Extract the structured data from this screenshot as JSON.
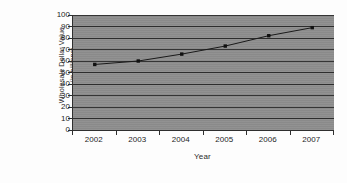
{
  "chart_data": {
    "type": "line",
    "title": "",
    "xlabel": "Year",
    "ylabel": "Wholesale Dollar Value (in billions)",
    "ylabel_line1": "Wholesale Dollar Value",
    "ylabel_line2": "(in billions)",
    "categories": [
      "2002",
      "2003",
      "2004",
      "2005",
      "2006",
      "2007"
    ],
    "values": [
      57,
      60,
      66,
      73,
      82,
      89
    ],
    "series": [
      {
        "name": "Wholesale Dollar Value",
        "values": [
          57,
          60,
          66,
          73,
          82,
          89
        ]
      }
    ],
    "ylim": [
      0,
      100
    ],
    "yticks": [
      0,
      10,
      20,
      30,
      40,
      50,
      60,
      70,
      80,
      90,
      100
    ],
    "ytick_labels": [
      "0",
      "10",
      "20",
      "30",
      "40",
      "50",
      "60",
      "70",
      "80",
      "90",
      "100"
    ],
    "grid": true,
    "grid_axis": "y",
    "legend": "none",
    "marker": "square",
    "colors": {
      "plot_background": "#8e8e8e",
      "figure_background": "#fdfdfd",
      "gridline": "#2e2e2e",
      "axis": "#2f2f2f",
      "line": "#1a1a1a",
      "marker": "#111111",
      "text": "#1d1d1d"
    }
  }
}
